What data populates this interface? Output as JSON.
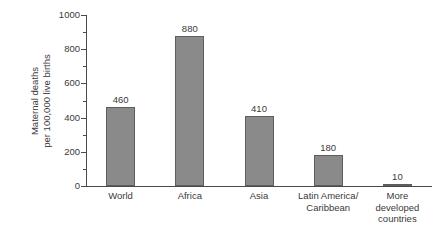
{
  "chart_data": {
    "type": "bar",
    "title": "",
    "subtitle": "",
    "xlabel": "",
    "ylabel": "Maternal deaths per 100,000 live births",
    "ylabel_lines": [
      "Maternal deaths",
      "per 100,000 live births"
    ],
    "categories": [
      "World",
      "Africa",
      "Asia",
      "Latin America/Caribbean",
      "More developed countries"
    ],
    "category_lines": [
      [
        "World"
      ],
      [
        "Africa"
      ],
      [
        "Asia"
      ],
      [
        "Latin America/",
        "Caribbean"
      ],
      [
        "More",
        "developed",
        "countries"
      ]
    ],
    "values": [
      460,
      880,
      410,
      180,
      10
    ],
    "value_labels": [
      "460",
      "880",
      "410",
      "180",
      "10"
    ],
    "ylim": [
      0,
      1000
    ],
    "y_major_ticks": [
      0,
      200,
      400,
      600,
      800,
      1000
    ],
    "y_major_tick_labels": [
      "0",
      "200",
      "400",
      "600",
      "800",
      "1000"
    ],
    "y_minor_ticks": [
      100,
      300,
      500,
      700,
      900
    ],
    "grid": false,
    "legend": false,
    "legend_position": "none",
    "bar_color": "#8a8a8a",
    "bar_border_color": "#5e5e5e",
    "axis_color": "#4a4a4a",
    "text_color": "#3a3a3a",
    "background_color": "#ffffff"
  }
}
